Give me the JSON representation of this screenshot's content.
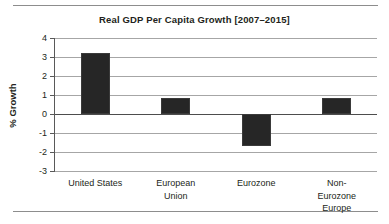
{
  "figure": {
    "title": "Real GDP Per Capita Growth [2007–2015]",
    "ylabel": "% Growth"
  },
  "axis": {
    "ytick_labels": [
      "4",
      "3",
      "2",
      "1",
      "0",
      "-1",
      "-2",
      "-3"
    ]
  },
  "categories": {
    "c0": "United States",
    "c1": "European\nUnion",
    "c2": "Eurozone",
    "c3": "Non-Eurozone\nEurope"
  },
  "chart_data": {
    "type": "bar",
    "title": "Real GDP Per Capita Growth [2007–2015]",
    "xlabel": "",
    "ylabel": "% Growth",
    "ylim": [
      -3,
      4
    ],
    "ytick_values": [
      4,
      3,
      2,
      1,
      0,
      -1,
      -2,
      -3
    ],
    "grid": true,
    "legend": "none",
    "categories": [
      "United States",
      "European Union",
      "Eurozone",
      "Non-Eurozone Europe"
    ],
    "values": [
      3.2,
      0.85,
      -1.7,
      0.85
    ],
    "bar_color": "#262626",
    "zero_line": 0
  }
}
